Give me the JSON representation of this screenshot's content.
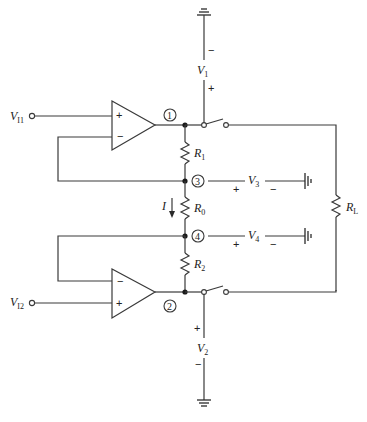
{
  "diagram": {
    "type": "circuit-schematic",
    "inputs": {
      "vi1": {
        "symbol": "V",
        "sub": "I1"
      },
      "vi2": {
        "symbol": "V",
        "sub": "I2"
      }
    },
    "opamps": [
      {
        "id": "opamp-1",
        "plus": "+",
        "minus": "−"
      },
      {
        "id": "opamp-2",
        "plus": "+",
        "minus": "−"
      }
    ],
    "nodes": [
      "1",
      "2",
      "3",
      "4"
    ],
    "resistors": {
      "r1": {
        "symbol": "R",
        "sub": "1"
      },
      "r0": {
        "symbol": "R",
        "sub": "0"
      },
      "r2": {
        "symbol": "R",
        "sub": "2"
      },
      "rl": {
        "symbol": "R",
        "sub": "L"
      }
    },
    "voltages": {
      "v1": {
        "symbol": "V",
        "sub": "1",
        "top_sign": "−",
        "bottom_sign": "+"
      },
      "v2": {
        "symbol": "V",
        "sub": "2",
        "top_sign": "+",
        "bottom_sign": "−"
      },
      "v3": {
        "symbol": "V",
        "sub": "3",
        "left_sign": "+",
        "right_sign": "−"
      },
      "v4": {
        "symbol": "V",
        "sub": "4",
        "left_sign": "+",
        "right_sign": "−"
      }
    },
    "current": {
      "symbol": "I"
    }
  }
}
